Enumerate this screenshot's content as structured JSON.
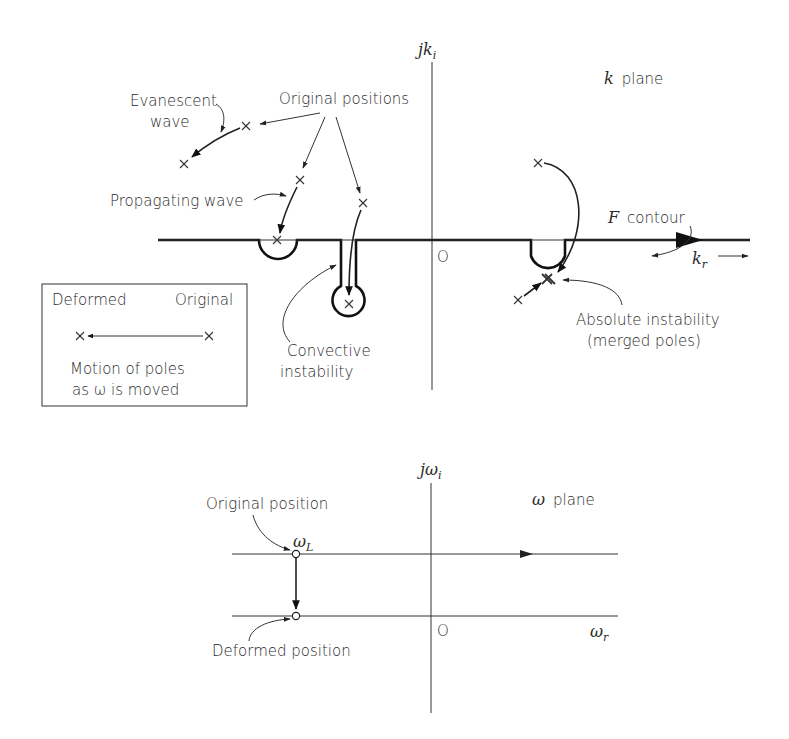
{
  "k_plane": {
    "title_var": "k",
    "title_rest": "plane",
    "vertical_axis_label_j": "j",
    "vertical_axis_label_var": "k",
    "vertical_axis_label_sub": "i",
    "horizontal_axis_label_var": "k",
    "horizontal_axis_label_sub": "r",
    "origin_label": "O",
    "contour_label_var": "F",
    "contour_label_rest": "contour",
    "annotations": {
      "original_positions": "Original positions",
      "evanescent_wave_1": "Evanescent",
      "evanescent_wave_2": "wave",
      "propagating_wave": "Propagating wave",
      "convective_1": "Convective",
      "convective_2": "instability",
      "absolute_1": "Absolute instability",
      "absolute_2": "(merged poles)"
    }
  },
  "legend": {
    "left_label": "Deformed",
    "right_label": "Original",
    "caption_1": "Motion of poles",
    "caption_2": "as ω is moved"
  },
  "omega_plane": {
    "title_var": "ω",
    "title_rest": "plane",
    "vertical_axis_label_j": "j",
    "vertical_axis_label_var": "ω",
    "vertical_axis_label_sub": "i",
    "horizontal_axis_label_var": "ω",
    "horizontal_axis_label_sub": "r",
    "origin_label": "O",
    "point_label_var": "ω",
    "point_label_sub": "L",
    "original_position": "Original position",
    "deformed_position": "Deformed position"
  }
}
